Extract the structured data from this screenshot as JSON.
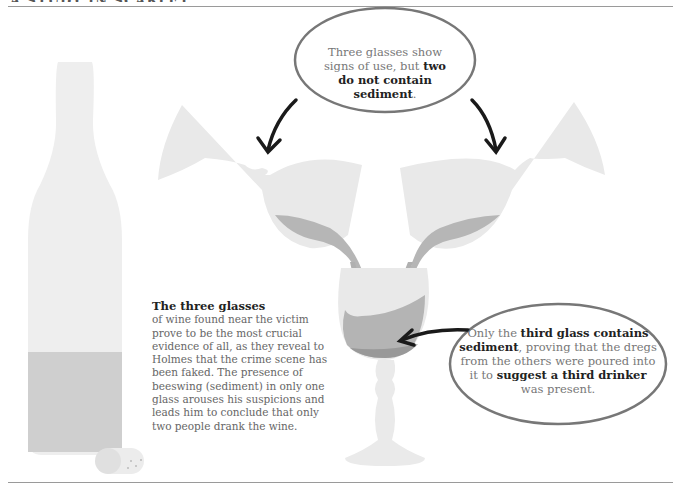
{
  "header": {
    "running_head": "A STUDY IN SCARLET"
  },
  "bubbles": {
    "top": {
      "text_before": "Three glasses show signs of use, but ",
      "bold": "two do not contain sediment",
      "text_after": "."
    },
    "right": {
      "text_1": "Only the ",
      "bold_1": "third glass contains sediment",
      "text_2": ", proving that the dregs from the others were poured into it to ",
      "bold_2": "suggest a third drinker",
      "text_3": " was present."
    }
  },
  "caption": {
    "lead": "The three glasses",
    "body": "of wine found near the victim prove to be the most crucial evidence of all, as they reveal to Holmes that the crime scene has been faked. The presence of beeswing (sediment) in only one glass arouses his suspicions and leads him to conclude that only two people drank the wine."
  },
  "colors": {
    "glass": "#e9e9e9",
    "wine": "#b4b4b4",
    "sediment": "#9a9a9a",
    "arrow": "#1a1a1a",
    "bubble_outline": "#777777"
  }
}
